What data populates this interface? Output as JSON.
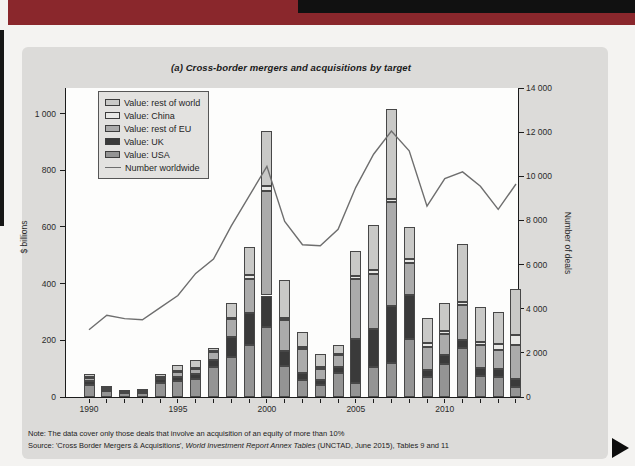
{
  "page": {
    "figure_title": "(a) Cross-border mergers and acquisitions by target",
    "note": "Note: The data cover only those deals that involve an acquisition of an equity of more than 10%",
    "source": {
      "prefix": "Source: 'Cross Border Mergers & Acquisitions', ",
      "italic": "World Investment Report Annex Tables",
      "suffix": " (UNCTAD, June 2015), Tables 9 and 11"
    }
  },
  "chart_data": {
    "type": "bar",
    "subtype": "stacked-bars-with-line-overlay",
    "title": "(a) Cross-border mergers and acquisitions by target",
    "grid": false,
    "legend_position": "top-left",
    "categories": [
      1990,
      1991,
      1992,
      1993,
      1994,
      1995,
      1996,
      1997,
      1998,
      1999,
      2000,
      2001,
      2002,
      2003,
      2004,
      2005,
      2006,
      2007,
      2008,
      2009,
      2010,
      2011,
      2012,
      2013,
      2014
    ],
    "series": [
      {
        "name": "Value: USA",
        "color": "#949494",
        "values": [
          41,
          22,
          14,
          13,
          50,
          57,
          62,
          105,
          140,
          183,
          246,
          110,
          60,
          42,
          83,
          48,
          106,
          120,
          205,
          70,
          115,
          172,
          74,
          71,
          36
        ]
      },
      {
        "name": "Value: UK",
        "color": "#3a3a3a",
        "values": [
          16,
          4,
          3,
          4,
          13,
          14,
          18,
          25,
          71,
          114,
          112,
          51,
          23,
          18,
          23,
          158,
          135,
          200,
          155,
          25,
          32,
          28,
          28,
          29,
          26
        ]
      },
      {
        "name": "Value: rest of EU",
        "color": "#ababab",
        "values": [
          10,
          5,
          4,
          4,
          8,
          18,
          21,
          28,
          65,
          120,
          369,
          109,
          85,
          39,
          41,
          211,
          193,
          368,
          112,
          82,
          74,
          123,
          80,
          65,
          121
        ]
      },
      {
        "name": "Value: China",
        "color": "#e8e8e6",
        "values": [
          2,
          1,
          1,
          2,
          1,
          2,
          2,
          3,
          4,
          14,
          17,
          8,
          8,
          8,
          4,
          11,
          14,
          11,
          14,
          14,
          12,
          11,
          12,
          23,
          35
        ]
      },
      {
        "name": "Value: rest of world",
        "color": "#c9c9c7",
        "values": [
          12,
          7,
          3,
          4,
          8,
          21,
          29,
          11,
          51,
          97,
          196,
          133,
          53,
          44,
          32,
          88,
          159,
          316,
          113,
          86,
          100,
          207,
          122,
          111,
          164
        ]
      }
    ],
    "line_series": {
      "name": "Number worldwide",
      "color": "#6e6e6e",
      "axis": "right",
      "values": [
        3050,
        3700,
        3550,
        3500,
        4050,
        4600,
        5600,
        6250,
        7750,
        9100,
        10450,
        7950,
        6900,
        6850,
        7600,
        9500,
        11000,
        12050,
        11150,
        8650,
        9900,
        10200,
        9550,
        8500,
        9650
      ]
    },
    "legend_order": [
      "Value: rest of world",
      "Value: China",
      "Value: rest of EU",
      "Value: UK",
      "Value: USA",
      "Number worldwide"
    ],
    "ylabel_left": "$ billions",
    "ylabel_right": "Number of deals",
    "left_axis": {
      "max": 1090,
      "ticks": [
        0,
        200,
        400,
        600,
        800,
        1000
      ],
      "tick_labels": [
        "0",
        "200",
        "400",
        "600",
        "800",
        "1 000"
      ]
    },
    "right_axis": {
      "max": 14000,
      "ticks": [
        0,
        2000,
        4000,
        6000,
        8000,
        10000,
        12000,
        14000
      ],
      "tick_labels": [
        "0",
        "2 000",
        "4 000",
        "6 000",
        "8 000",
        "10 000",
        "12 000",
        "14 000"
      ]
    },
    "x_tick_labels": {
      "1990": "1990",
      "1995": "1995",
      "2000": "2000",
      "2005": "2005",
      "2010": "2010"
    }
  }
}
